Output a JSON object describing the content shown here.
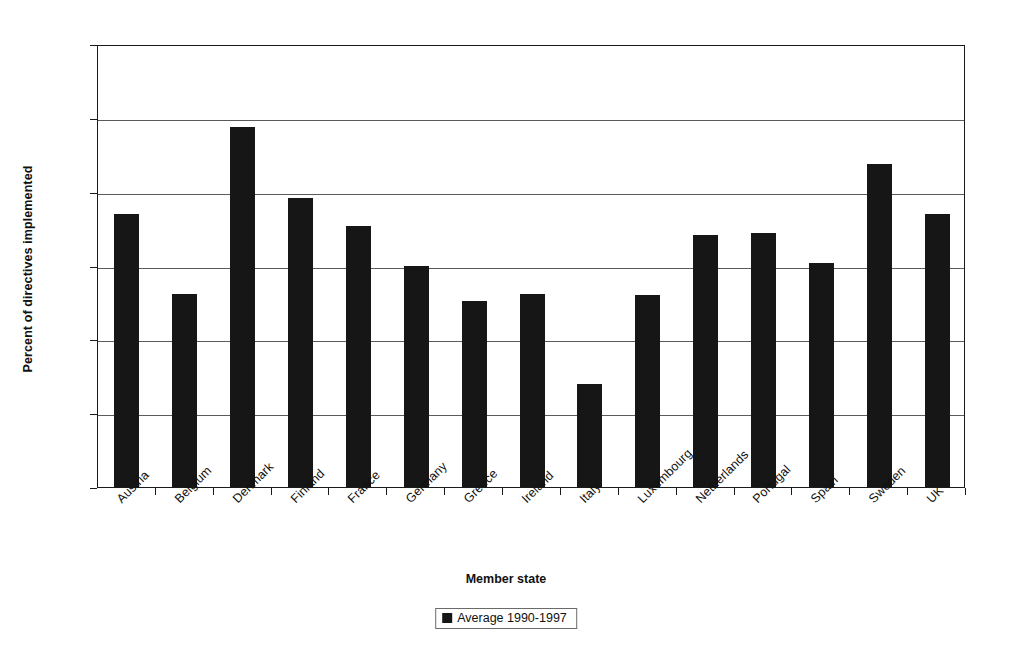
{
  "chart_data": {
    "type": "bar",
    "title": "",
    "xlabel": "Member state",
    "ylabel": "Percent of directives implemented",
    "ylim": [
      70,
      100
    ],
    "yticks": [
      70,
      75,
      80,
      85,
      90,
      95,
      100
    ],
    "grid": true,
    "legend_position": "bottom",
    "categories": [
      "Austria",
      "Belgium",
      "Denmark",
      "Finland",
      "France",
      "Germany",
      "Greece",
      "Ireland",
      "Italy",
      "Luxembourg",
      "Netherlands",
      "Portugal",
      "Spain",
      "Sweden",
      "UK"
    ],
    "series": [
      {
        "name": "Average 1990-1997",
        "color": "#161616",
        "values": [
          88.5,
          83.1,
          94.4,
          89.6,
          87.7,
          85.0,
          82.6,
          83.1,
          77.0,
          83.0,
          87.1,
          87.2,
          85.2,
          91.9,
          88.5
        ]
      }
    ],
    "values": [
      88.5,
      83.1,
      94.4,
      89.6,
      87.7,
      85.0,
      82.6,
      83.1,
      77.0,
      83.0,
      87.1,
      87.2,
      85.2,
      91.9,
      88.5
    ]
  },
  "legend": {
    "entries": [
      {
        "label": "Average 1990-1997",
        "color": "#161616"
      }
    ]
  }
}
